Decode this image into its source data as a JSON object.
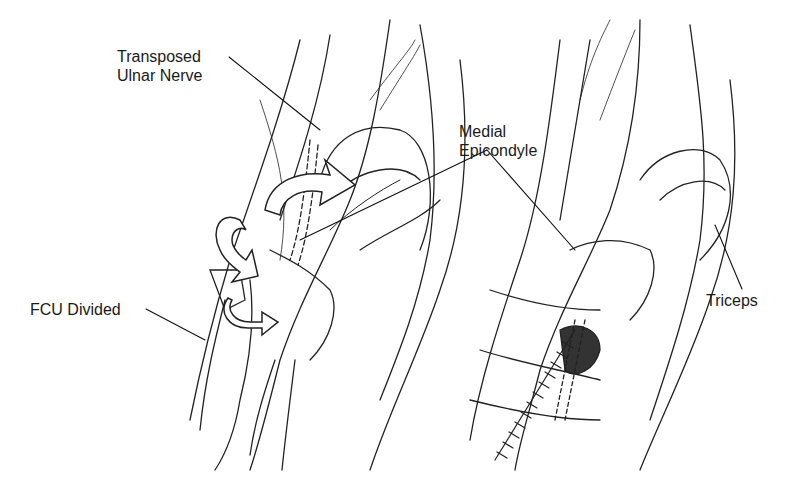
{
  "figure": {
    "panels": [
      {
        "id": "left",
        "description": "Elbow with FCU divided and ulnar nerve transposed"
      },
      {
        "id": "right",
        "description": "Elbow after FCU repair over transposed nerve"
      }
    ],
    "labels": {
      "transposed_ulnar_nerve_line1": "Transposed",
      "transposed_ulnar_nerve_line2": "Ulnar Nerve",
      "medial_epicondyle_line1": "Medial",
      "medial_epicondyle_line2": "Epicondyle",
      "fcu_divided": "FCU Divided",
      "triceps": "Triceps"
    },
    "colors": {
      "ink": "#1a1a1a",
      "background": "#ffffff"
    }
  }
}
